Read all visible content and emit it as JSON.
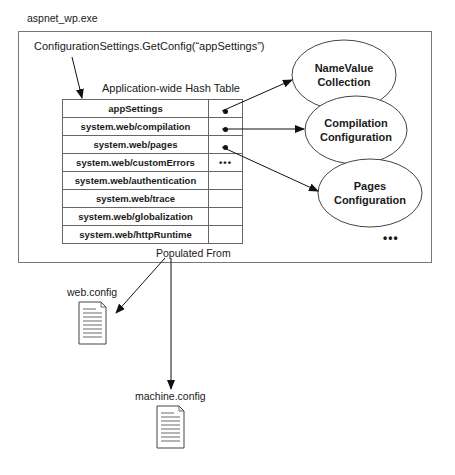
{
  "process": {
    "label": "aspnet_wp.exe"
  },
  "call": {
    "label": "ConfigurationSettings.GetConfig(“appSettings”)"
  },
  "hash_table": {
    "caption": "Application-wide Hash Table",
    "rows": [
      {
        "key": "appSettings",
        "value": "•"
      },
      {
        "key": "system.web/compilation",
        "value": "•"
      },
      {
        "key": "system.web/pages",
        "value": "•"
      },
      {
        "key": "system.web/customErrors",
        "value": "•••"
      },
      {
        "key": "system.web/authentication",
        "value": ""
      },
      {
        "key": "system.web/trace",
        "value": ""
      },
      {
        "key": "system.web/globalization",
        "value": ""
      },
      {
        "key": "system.web/httpRuntime",
        "value": ""
      }
    ]
  },
  "objects": [
    {
      "line1": "NameValue",
      "line2": "Collection"
    },
    {
      "line1": "Compilation",
      "line2": "Configuration"
    },
    {
      "line1": "Pages",
      "line2": "Configuration"
    }
  ],
  "objects_more": "•••",
  "populated_from": "Populated From",
  "files": [
    {
      "label": "web.config",
      "icon": "document-icon"
    },
    {
      "label": "machine.config",
      "icon": "document-icon"
    }
  ]
}
